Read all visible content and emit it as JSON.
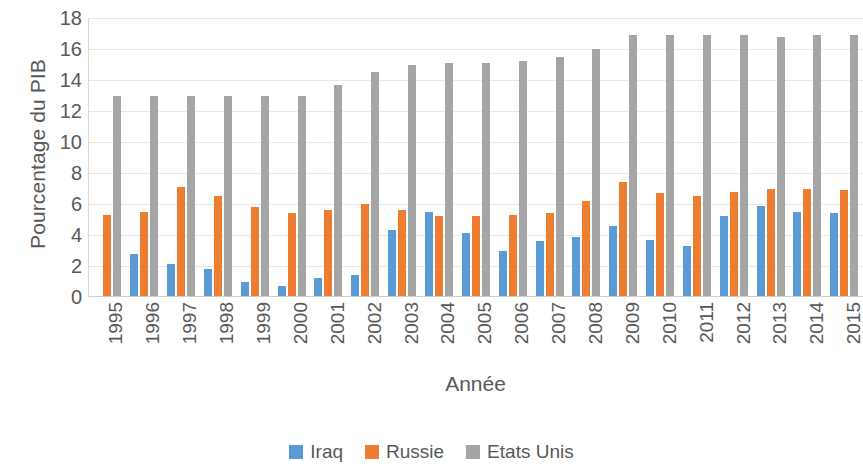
{
  "chart_data": {
    "type": "bar",
    "title": "",
    "xlabel": "Année",
    "ylabel": "Pourcentage du PIB",
    "ylim": [
      0,
      18
    ],
    "ytick_step": 2,
    "yticks": [
      18,
      16,
      14,
      12,
      10,
      8,
      6,
      4,
      2,
      0
    ],
    "grid": true,
    "legend_position": "bottom",
    "categories": [
      "1995",
      "1996",
      "1997",
      "1998",
      "1999",
      "2000",
      "2001",
      "2002",
      "2003",
      "2004",
      "2005",
      "2006",
      "2007",
      "2008",
      "2009",
      "2010",
      "2011",
      "2012",
      "2013",
      "2014",
      "2015"
    ],
    "series": [
      {
        "name": "Iraq",
        "color": "#5B9BD5",
        "values": [
          0,
          2.8,
          2.1,
          1.8,
          1.0,
          0.7,
          1.2,
          1.4,
          4.3,
          5.5,
          4.1,
          3.0,
          3.6,
          3.9,
          4.6,
          3.7,
          3.3,
          5.2,
          5.9,
          5.5,
          5.4
        ]
      },
      {
        "name": "Russie",
        "color": "#ED7D31",
        "values": [
          5.3,
          5.5,
          7.1,
          6.5,
          5.8,
          5.4,
          5.6,
          6.0,
          5.6,
          5.2,
          5.2,
          5.3,
          5.4,
          6.2,
          7.4,
          6.7,
          6.5,
          6.8,
          7.0,
          7.0,
          6.9
        ]
      },
      {
        "name": "Etats Unis",
        "color": "#A5A5A5",
        "values": [
          13.0,
          13.0,
          13.0,
          13.0,
          13.0,
          13.0,
          13.7,
          14.5,
          15.0,
          15.1,
          15.1,
          15.2,
          15.5,
          16.0,
          16.9,
          16.9,
          16.9,
          16.9,
          16.8,
          16.9,
          16.9
        ]
      }
    ]
  },
  "legend": {
    "items": [
      {
        "label": "Iraq",
        "color": "#5B9BD5"
      },
      {
        "label": "Russie",
        "color": "#ED7D31"
      },
      {
        "label": "Etats Unis",
        "color": "#A5A5A5"
      }
    ]
  }
}
